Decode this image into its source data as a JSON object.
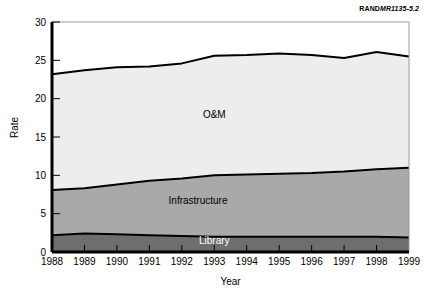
{
  "corner_identifier": {
    "org": "RAND",
    "document_number": "MR1135-5.2"
  },
  "chart_data": {
    "type": "area",
    "stacked": true,
    "title": "",
    "xlabel": "Year",
    "ylabel": "Rate",
    "categories": [
      1988,
      1989,
      1990,
      1991,
      1992,
      1993,
      1994,
      1995,
      1996,
      1997,
      1998,
      1999
    ],
    "x_tick_labels": [
      "1988",
      "1989",
      "1990",
      "1991",
      "1992",
      "1993",
      "1994",
      "1995",
      "1996",
      "1997",
      "1998",
      "1999"
    ],
    "y_tick_labels": [
      "0",
      "5",
      "10",
      "15",
      "20",
      "25",
      "30"
    ],
    "y_ticks": [
      0,
      5,
      10,
      15,
      20,
      25,
      30
    ],
    "ylim": [
      0,
      30
    ],
    "xlim": [
      1988,
      1999
    ],
    "grid": false,
    "legend": "inline-area-labels",
    "series": [
      {
        "name": "Library",
        "color": "#6e6e6e",
        "label_color": "#ffffff",
        "values": [
          2.2,
          2.4,
          2.3,
          2.2,
          2.1,
          2.0,
          2.0,
          2.0,
          2.0,
          2.0,
          2.0,
          1.9
        ],
        "cumulative_top": [
          2.2,
          2.4,
          2.3,
          2.2,
          2.1,
          2.0,
          2.0,
          2.0,
          2.0,
          2.0,
          2.0,
          1.9
        ]
      },
      {
        "name": "Infrastructure",
        "color": "#a9a9a9",
        "label_color": "#000000",
        "values": [
          5.9,
          5.9,
          6.5,
          7.1,
          7.5,
          8.0,
          8.1,
          8.2,
          8.3,
          8.5,
          8.8,
          9.1
        ],
        "cumulative_top": [
          8.1,
          8.3,
          8.8,
          9.3,
          9.6,
          10.0,
          10.1,
          10.2,
          10.3,
          10.5,
          10.8,
          11.0
        ]
      },
      {
        "name": "O&M",
        "color": "#ededed",
        "label_color": "#000000",
        "values": [
          15.1,
          15.4,
          15.3,
          14.9,
          15.0,
          15.6,
          15.6,
          15.7,
          15.4,
          14.8,
          15.3,
          14.5
        ],
        "cumulative_top": [
          23.2,
          23.7,
          24.1,
          24.2,
          24.6,
          25.6,
          25.7,
          25.9,
          25.7,
          25.3,
          26.1,
          25.5
        ]
      }
    ],
    "area_labels": [
      {
        "name": "O&M",
        "x_value": 1993,
        "y_value": 17.5
      },
      {
        "name": "Infrastructure",
        "x_value": 1992.5,
        "y_value": 6.2
      },
      {
        "name": "Library",
        "x_value": 1993,
        "y_value": 1.0
      }
    ]
  }
}
